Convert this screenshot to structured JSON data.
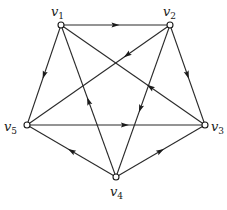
{
  "diagram": {
    "type": "directed-graph",
    "nodes": [
      {
        "id": "v1",
        "name": "v",
        "sub": "1"
      },
      {
        "id": "v2",
        "name": "v",
        "sub": "2"
      },
      {
        "id": "v3",
        "name": "v",
        "sub": "3"
      },
      {
        "id": "v4",
        "name": "v",
        "sub": "4"
      },
      {
        "id": "v5",
        "name": "v",
        "sub": "5"
      }
    ],
    "edges": [
      {
        "from": "v1",
        "to": "v2"
      },
      {
        "from": "v2",
        "to": "v3"
      },
      {
        "from": "v4",
        "to": "v3"
      },
      {
        "from": "v4",
        "to": "v5"
      },
      {
        "from": "v1",
        "to": "v5"
      },
      {
        "from": "v5",
        "to": "v3"
      },
      {
        "from": "v4",
        "to": "v1"
      },
      {
        "from": "v2",
        "to": "v4"
      },
      {
        "from": "v3",
        "to": "v1"
      },
      {
        "from": "v2",
        "to": "v5"
      }
    ],
    "colors": {
      "line": "#2a2a2a",
      "node_fill": "#ffffff",
      "background": "#ffffff"
    }
  }
}
